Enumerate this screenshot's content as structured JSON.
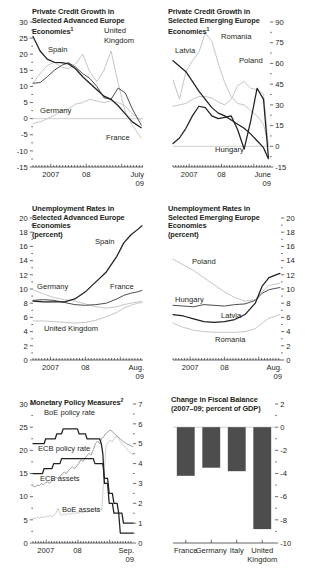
{
  "figure": {
    "panel_count": 4
  },
  "panels": [
    {
      "id": "private-credit-advanced",
      "title_lines": [
        "Private Credit Growth in",
        "Selected Advanced Europe",
        "Economies"
      ],
      "title_sup": "1",
      "axis_side": "left",
      "yticks": [
        "30",
        "25",
        "20",
        "15",
        "10",
        "5",
        "0",
        "-5",
        "-10",
        "-15"
      ],
      "xticks": [
        "2007",
        "08"
      ],
      "xlast": [
        "July",
        "09"
      ],
      "series_labels": [
        "Spain",
        "Germany",
        "United",
        "Kingdom",
        "France"
      ],
      "chart_data": {
        "type": "line",
        "title": "Private Credit Growth in Selected Advanced Europe Economies",
        "xlabel": "",
        "ylabel": "percent",
        "ylim": [
          -15,
          30
        ],
        "xlim": [
          2006.5,
          2009.6
        ],
        "ytick_values": [
          30,
          25,
          20,
          15,
          10,
          5,
          0,
          -5,
          -10,
          -15
        ],
        "xtick_labels": [
          "2007",
          "08",
          "July 09"
        ],
        "grid": false,
        "legend": "inline-annotations",
        "x": [
          2006.5,
          2006.7,
          2006.9,
          2007.1,
          2007.3,
          2007.5,
          2007.7,
          2007.9,
          2008.1,
          2008.3,
          2008.5,
          2008.7,
          2008.9,
          2009.1,
          2009.3,
          2009.55
        ],
        "series": [
          {
            "name": "Spain",
            "color": "#231f20",
            "values": [
              25.5,
              21.0,
              18.5,
              17.5,
              17.4,
              17.0,
              15.5,
              13.0,
              11.0,
              9.0,
              7.0,
              6.0,
              4.0,
              1.5,
              -1.0,
              -2.8
            ]
          },
          {
            "name": "France",
            "color": "#4d4d4d",
            "values": [
              11.0,
              11.2,
              13.0,
              15.0,
              16.5,
              17.4,
              16.0,
              14.0,
              12.5,
              10.0,
              6.5,
              6.0,
              9.5,
              8.0,
              3.0,
              -2.0
            ]
          },
          {
            "name": "Germany",
            "color": "#c6c6c6",
            "values": [
              -1.5,
              -1.0,
              0.0,
              1.0,
              2.5,
              3.0,
              4.5,
              5.0,
              6.0,
              5.5,
              5.0,
              5.5,
              5.0,
              4.0,
              1.5,
              -0.5
            ]
          },
          {
            "name": "United Kingdom",
            "color": "#c6c6c6",
            "values": [
              11.0,
              14.0,
              16.5,
              17.5,
              16.0,
              15.5,
              17.0,
              20.0,
              14.5,
              11.5,
              15.0,
              21.0,
              11.0,
              2.0,
              -2.0,
              -6.0
            ]
          }
        ]
      }
    },
    {
      "id": "private-credit-emerging",
      "title_lines": [
        "Private Credit Growth in",
        "Selected Emerging Europe",
        "Economies"
      ],
      "title_sup": "1",
      "axis_side": "right",
      "yticks": [
        "90",
        "75",
        "60",
        "45",
        "30",
        "15",
        "0",
        "-15"
      ],
      "xticks": [
        "2007",
        "08"
      ],
      "xlast": [
        "June",
        "09"
      ],
      "series_labels": [
        "Latvia",
        "Romania",
        "Poland",
        "Hungary"
      ],
      "chart_data": {
        "type": "line",
        "title": "Private Credit Growth in Selected Emerging Europe Economies",
        "xlabel": "",
        "ylabel": "percent",
        "ylim": [
          -15,
          90
        ],
        "xlim": [
          2006.5,
          2009.5
        ],
        "ytick_values": [
          90,
          75,
          60,
          45,
          30,
          15,
          0,
          -15
        ],
        "xtick_labels": [
          "2007",
          "08",
          "June 09"
        ],
        "grid": false,
        "legend": "inline-annotations",
        "x": [
          2006.5,
          2006.7,
          2006.9,
          2007.1,
          2007.3,
          2007.5,
          2007.7,
          2007.9,
          2008.1,
          2008.3,
          2008.5,
          2008.7,
          2008.9,
          2009.1,
          2009.3,
          2009.45
        ],
        "series": [
          {
            "name": "Latvia",
            "color": "#231f20",
            "values": [
              62.0,
              58.0,
              54.0,
              47.0,
              40.0,
              34.0,
              28.0,
              24.0,
              22.0,
              19.0,
              16.0,
              13.0,
              9.0,
              4.0,
              -1.0,
              -9.0
            ]
          },
          {
            "name": "Hungary",
            "color": "#231f20",
            "values": [
              2.0,
              6.0,
              13.0,
              22.0,
              29.0,
              28.0,
              22.0,
              20.0,
              21.0,
              22.0,
              12.0,
              -2.0,
              18.0,
              42.0,
              34.0,
              -8.0
            ]
          },
          {
            "name": "Romania",
            "color": "#c6c6c6",
            "values": [
              48.0,
              34.0,
              54.0,
              62.0,
              68.0,
              82.0,
              76.0,
              60.0,
              46.0,
              36.0,
              31.0,
              30.0,
              26.0,
              22.0,
              16.0,
              1.0
            ]
          },
          {
            "name": "Poland",
            "color": "#c6c6c6",
            "values": [
              29.0,
              30.0,
              31.0,
              34.0,
              36.0,
              36.0,
              35.0,
              32.0,
              30.0,
              34.0,
              44.0,
              47.0,
              42.0,
              41.0,
              38.0,
              0.0
            ]
          }
        ]
      }
    },
    {
      "id": "unemployment-advanced",
      "title_lines": [
        "Unemployment Rates in",
        "Selected Advanced Europe",
        "Economies",
        "(percent)"
      ],
      "title_sup": "",
      "axis_side": "left",
      "yticks": [
        "20",
        "18",
        "16",
        "14",
        "12",
        "10",
        "8",
        "6",
        "4",
        "2",
        "0"
      ],
      "xticks": [
        "2007",
        "08"
      ],
      "xlast": [
        "Aug.",
        "09"
      ],
      "series_labels": [
        "Spain",
        "Germany",
        "France",
        "United Kingdom"
      ],
      "chart_data": {
        "type": "line",
        "title": "Unemployment Rates in Selected Advanced Europe Economies (percent)",
        "xlabel": "",
        "ylabel": "percent",
        "ylim": [
          0,
          20
        ],
        "xlim": [
          2006.5,
          2009.65
        ],
        "ytick_values": [
          20,
          18,
          16,
          14,
          12,
          10,
          8,
          6,
          4,
          2,
          0
        ],
        "xtick_labels": [
          "2007",
          "08",
          "Aug. 09"
        ],
        "grid": false,
        "legend": "inline-annotations",
        "x": [
          2006.5,
          2006.8,
          2007.1,
          2007.4,
          2007.7,
          2008.0,
          2008.3,
          2008.6,
          2008.9,
          2009.1,
          2009.3,
          2009.5,
          2009.62
        ],
        "series": [
          {
            "name": "Spain",
            "color": "#231f20",
            "values": [
              8.3,
              8.2,
              8.2,
              8.2,
              8.6,
              9.6,
              11.0,
              12.4,
              14.6,
              16.5,
              17.6,
              18.4,
              18.9
            ]
          },
          {
            "name": "France",
            "color": "#4d4d4d",
            "values": [
              8.4,
              8.5,
              8.4,
              8.1,
              7.8,
              7.7,
              7.8,
              8.0,
              8.6,
              9.1,
              9.4,
              9.6,
              9.8
            ]
          },
          {
            "name": "Germany",
            "color": "#c6c6c6",
            "values": [
              9.9,
              9.3,
              8.8,
              8.5,
              8.3,
              7.9,
              7.5,
              7.3,
              7.5,
              7.8,
              8.0,
              8.2,
              8.2
            ]
          },
          {
            "name": "United Kingdom",
            "color": "#c6c6c6",
            "values": [
              5.5,
              5.5,
              5.4,
              5.3,
              5.2,
              5.3,
              5.6,
              6.1,
              6.7,
              7.3,
              7.7,
              8.0,
              8.1
            ]
          }
        ]
      }
    },
    {
      "id": "unemployment-emerging",
      "title_lines": [
        "Unemployment Rates in",
        "Selected Emerging Europe",
        "Economies",
        "(percent)"
      ],
      "title_sup": "",
      "axis_side": "right",
      "yticks": [
        "20",
        "18",
        "16",
        "14",
        "12",
        "10",
        "8",
        "6",
        "4",
        "2",
        "0"
      ],
      "xticks": [
        "2007",
        "08"
      ],
      "xlast": [
        "Aug.",
        "09"
      ],
      "series_labels": [
        "Poland",
        "Hungary",
        "Latvia",
        "Romania"
      ],
      "chart_data": {
        "type": "line",
        "title": "Unemployment Rates in Selected Emerging Europe Economies (percent)",
        "xlabel": "",
        "ylabel": "percent",
        "ylim": [
          0,
          20
        ],
        "xlim": [
          2006.5,
          2009.65
        ],
        "ytick_values": [
          20,
          18,
          16,
          14,
          12,
          10,
          8,
          6,
          4,
          2,
          0
        ],
        "xtick_labels": [
          "2007",
          "08",
          "Aug. 09"
        ],
        "grid": false,
        "legend": "inline-annotations",
        "x": [
          2006.5,
          2006.8,
          2007.1,
          2007.4,
          2007.7,
          2008.0,
          2008.3,
          2008.6,
          2008.9,
          2009.1,
          2009.3,
          2009.5,
          2009.62
        ],
        "series": [
          {
            "name": "Poland",
            "color": "#c6c6c6",
            "values": [
              14.2,
              13.4,
              12.6,
              11.6,
              10.6,
              9.6,
              8.8,
              8.3,
              8.5,
              9.6,
              10.5,
              10.7,
              10.8
            ]
          },
          {
            "name": "Hungary",
            "color": "#4d4d4d",
            "values": [
              7.7,
              7.6,
              7.5,
              7.8,
              7.7,
              7.6,
              7.8,
              7.9,
              8.4,
              9.4,
              9.9,
              10.1,
              10.2
            ]
          },
          {
            "name": "Latvia",
            "color": "#231f20",
            "values": [
              6.4,
              6.2,
              5.8,
              5.4,
              5.3,
              5.4,
              5.7,
              6.4,
              8.0,
              10.4,
              11.6,
              12.0,
              12.2
            ]
          },
          {
            "name": "Romania",
            "color": "#c6c6c6",
            "values": [
              5.2,
              4.6,
              4.2,
              4.0,
              3.9,
              3.9,
              3.9,
              4.0,
              4.4,
              5.2,
              5.9,
              6.2,
              6.4
            ]
          }
        ]
      }
    },
    {
      "id": "monetary-policy",
      "title_lines": [
        "Monetary Policy Measures"
      ],
      "title_sup": "2",
      "axis_side": "both",
      "yticks": [
        "30",
        "25",
        "20",
        "15",
        "10",
        "5",
        "0"
      ],
      "yticks_right": [
        "7",
        "6",
        "5",
        "4",
        "3",
        "2",
        "1",
        "0"
      ],
      "xticks": [
        "2007",
        "08"
      ],
      "xlast": [
        "Sep.",
        "09"
      ],
      "series_labels": [
        "BoE policy rate",
        "ECB policy rate",
        "ECB assets",
        "BoE assets"
      ],
      "chart_data": {
        "type": "line",
        "title": "Monetary Policy Measures",
        "xlabel": "",
        "ylabel_left": "assets (percent of GDP)",
        "ylabel_right": "policy rate (percent)",
        "ylim_left": [
          0,
          30
        ],
        "ylim_right": [
          0,
          7
        ],
        "xlim": [
          2006.6,
          2009.75
        ],
        "ytick_values_left": [
          30,
          25,
          20,
          15,
          10,
          5,
          0
        ],
        "ytick_values_right": [
          7,
          6,
          5,
          4,
          3,
          2,
          1,
          0
        ],
        "xtick_labels": [
          "2007",
          "08",
          "Sep. 09"
        ],
        "grid": false,
        "legend": "inline-annotations",
        "series": [
          {
            "name": "BoE policy rate",
            "axis": "right",
            "color": "#231f20",
            "step": true,
            "x": [
              2006.6,
              2006.95,
              2007.0,
              2007.3,
              2007.35,
              2007.5,
              2007.55,
              2008.0,
              2008.05,
              2008.25,
              2008.3,
              2008.7,
              2008.75,
              2008.8,
              2008.85,
              2008.95,
              2009.0,
              2009.1,
              2009.15,
              2009.3,
              2009.35,
              2009.75
            ],
            "values": [
              5.0,
              5.0,
              5.25,
              5.25,
              5.5,
              5.5,
              5.75,
              5.75,
              5.5,
              5.5,
              5.25,
              5.25,
              5.0,
              4.5,
              3.0,
              3.0,
              2.0,
              2.0,
              1.5,
              1.5,
              0.5,
              0.5
            ]
          },
          {
            "name": "ECB policy rate",
            "axis": "right",
            "color": "#231f20",
            "step": true,
            "x": [
              2006.6,
              2006.9,
              2006.95,
              2007.2,
              2007.25,
              2007.45,
              2007.5,
              2008.5,
              2008.55,
              2008.8,
              2008.85,
              2008.95,
              2009.0,
              2009.1,
              2009.15,
              2009.25,
              2009.3,
              2009.4,
              2009.45,
              2009.75
            ],
            "values": [
              3.5,
              3.5,
              3.75,
              3.75,
              4.0,
              4.0,
              4.25,
              4.25,
              4.0,
              4.0,
              3.25,
              3.25,
              2.5,
              2.5,
              2.0,
              2.0,
              1.5,
              1.5,
              1.0,
              1.0
            ]
          },
          {
            "name": "ECB assets",
            "axis": "left",
            "color": "#8c8c8c",
            "values": [
              12.3,
              12.1,
              12.5,
              12.4,
              12.8,
              12.6,
              13.0,
              13.2,
              12.9,
              13.4,
              13.8,
              14.2,
              13.9,
              14.4,
              14.9,
              15.3,
              15.0,
              15.6,
              16.1,
              16.4,
              16.0,
              16.6,
              17.2,
              18.0,
              17.6,
              18.3,
              18.9,
              19.4,
              19.0,
              20.2,
              21.5,
              22.0,
              21.4,
              22.6,
              23.0,
              23.6,
              24.0,
              24.4,
              24.1,
              23.6,
              23.2,
              22.8,
              22.4,
              22.0,
              21.7,
              21.4,
              21.2,
              21.0,
              20.8
            ]
          },
          {
            "name": "BoE assets",
            "axis": "left",
            "color": "#c6c6c6",
            "values": [
              5.4,
              5.3,
              5.5,
              5.4,
              5.6,
              5.5,
              5.8,
              5.6,
              5.9,
              5.7,
              6.0,
              6.4,
              7.5,
              6.2,
              6.0,
              6.3,
              6.1,
              6.4,
              6.2,
              6.5,
              6.3,
              6.6,
              6.4,
              6.7,
              6.5,
              6.8,
              6.6,
              6.9,
              7.0,
              6.8,
              7.1,
              7.0,
              7.3,
              7.1,
              14.0,
              20.8,
              21.6,
              22.2,
              21.8,
              22.6,
              23.1,
              22.5,
              21.9,
              21.3,
              20.8,
              20.3,
              19.8,
              19.4,
              19.0
            ]
          }
        ]
      }
    },
    {
      "id": "fiscal-balance",
      "title_lines": [
        "Change in Fiscal Balance",
        "(2007–09; percent of GDP)"
      ],
      "title_sup": "",
      "axis_side": "right",
      "yticks": [
        "2",
        "0",
        "-2",
        "-4",
        "-6",
        "-8",
        "-10"
      ],
      "xticks": [
        "France",
        "Germany",
        "Italy",
        "United",
        "Kingdom"
      ],
      "chart_data": {
        "type": "bar",
        "title": "Change in Fiscal Balance (2007–09; percent of GDP)",
        "xlabel": "",
        "ylabel": "percent of GDP",
        "ylim": [
          -10,
          2
        ],
        "ytick_values": [
          2,
          0,
          -2,
          -4,
          -6,
          -8,
          -10
        ],
        "grid": false,
        "categories": [
          "France",
          "Germany",
          "Italy",
          "United Kingdom"
        ],
        "values": [
          -4.2,
          -3.5,
          -3.8,
          -8.8
        ],
        "bar_color": "#4d4d4d"
      }
    }
  ]
}
